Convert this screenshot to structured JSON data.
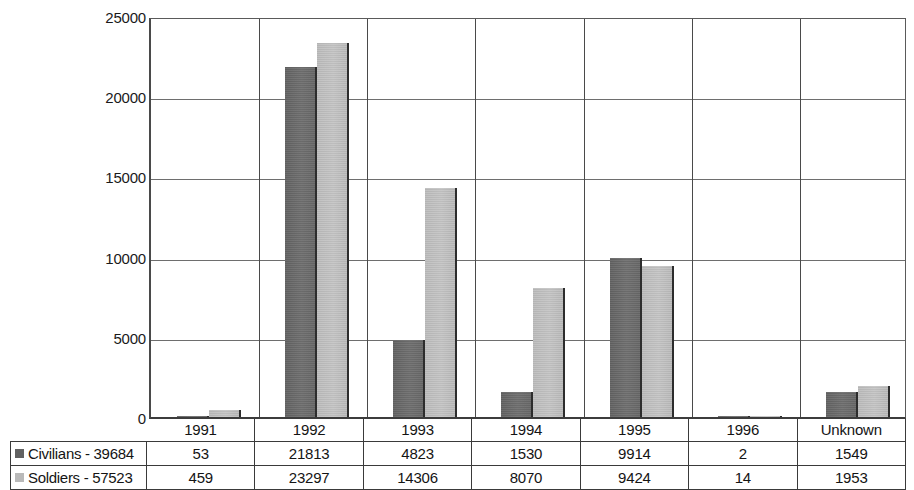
{
  "chart_data": {
    "type": "bar",
    "title": "",
    "xlabel": "",
    "ylabel": "",
    "ylim": [
      0,
      25000
    ],
    "yticks": [
      0,
      5000,
      10000,
      15000,
      20000,
      25000
    ],
    "ytick_labels": [
      "0",
      "5000",
      "10000",
      "15000",
      "20000",
      "25000"
    ],
    "grid": true,
    "legend_position": "table-left",
    "categories": [
      "1991",
      "1992",
      "1993",
      "1994",
      "1995",
      "1996",
      "Unknown"
    ],
    "series": [
      {
        "name": "Civilians - 39684",
        "short_name": "Civilians",
        "total": 39684,
        "color": "#636363",
        "values": [
          53,
          21813,
          4823,
          1530,
          9914,
          2,
          1549
        ],
        "value_labels": [
          "53",
          "21813",
          "4823",
          "1530",
          "9914",
          "2",
          "1549"
        ]
      },
      {
        "name": "Soldiers - 57523",
        "short_name": "Soldiers",
        "total": 57523,
        "color": "#b9b9b9",
        "values": [
          459,
          23297,
          14306,
          8070,
          9424,
          14,
          1953
        ],
        "value_labels": [
          "459",
          "23297",
          "14306",
          "8070",
          "9424",
          "14",
          "1953"
        ]
      }
    ]
  },
  "colors": {
    "civilians": "#636363",
    "soldiers": "#b9b9b9",
    "axis": "#3c3c3c",
    "gridline": "#6e6e6e",
    "background": "#ffffff",
    "text": "#141414"
  }
}
